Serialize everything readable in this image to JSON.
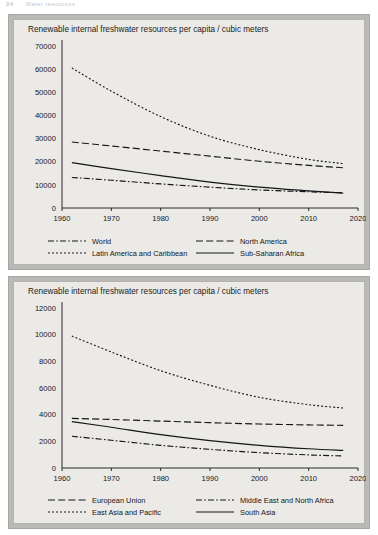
{
  "page_header": {
    "number": "24",
    "text": "Water resources"
  },
  "figures": [
    {
      "id": "figure-1",
      "title": "Renewable internal freshwater resources per capita / cubic meters",
      "chart_data": {
        "type": "line",
        "title": "Renewable internal freshwater resources per capita / cubic meters",
        "xlabel": "",
        "ylabel": "",
        "xlim": [
          1960,
          2020
        ],
        "ylim": [
          0,
          70000
        ],
        "xticks": [
          1960,
          1970,
          1980,
          1990,
          2000,
          2010,
          2020
        ],
        "yticks": [
          0,
          10000,
          20000,
          30000,
          40000,
          50000,
          60000,
          70000
        ],
        "grid": false,
        "legend_position": "below",
        "x": [
          1962,
          1970,
          1980,
          1990,
          2000,
          2010,
          2017
        ],
        "series": [
          {
            "name": "World",
            "dash": "dash-dot",
            "values": [
              13200,
              12000,
              10400,
              9000,
              7800,
              7000,
              6600
            ]
          },
          {
            "name": "North America",
            "dash": "dashed",
            "values": [
              28500,
              26800,
              24600,
              22400,
              20200,
              18400,
              17400
            ]
          },
          {
            "name": "Latin America and Caribbean",
            "dash": "dotted",
            "values": [
              60500,
              50500,
              39500,
              31000,
              25200,
              21000,
              19200
            ]
          },
          {
            "name": "Sub-Saharan Africa",
            "dash": "solid",
            "values": [
              19600,
              17000,
              14000,
              11200,
              9000,
              7400,
              6400
            ]
          }
        ]
      }
    },
    {
      "id": "figure-2",
      "title": "Renewable internal freshwater resources per capita / cubic meters",
      "chart_data": {
        "type": "line",
        "title": "Renewable internal freshwater resources per capita / cubic meters",
        "xlabel": "",
        "ylabel": "",
        "xlim": [
          1960,
          2020
        ],
        "ylim": [
          0,
          12000
        ],
        "xticks": [
          1960,
          1970,
          1980,
          1990,
          2000,
          2010,
          2020
        ],
        "yticks": [
          0,
          2000,
          4000,
          6000,
          8000,
          10000,
          12000
        ],
        "grid": false,
        "legend_position": "below",
        "x": [
          1962,
          1970,
          1980,
          1990,
          2000,
          2010,
          2017
        ],
        "series": [
          {
            "name": "European Union",
            "dash": "dashed",
            "values": [
              3720,
              3640,
              3520,
              3400,
              3300,
              3230,
              3200
            ]
          },
          {
            "name": "Middle East and North Africa",
            "dash": "dash-dot",
            "values": [
              2380,
              2080,
              1700,
              1400,
              1150,
              980,
              900
            ]
          },
          {
            "name": "East Asia and Pacific",
            "dash": "dotted",
            "values": [
              9900,
              8700,
              7300,
              6200,
              5300,
              4750,
              4500
            ]
          },
          {
            "name": "South Asia",
            "dash": "solid",
            "values": [
              3480,
              3060,
              2500,
              2050,
              1700,
              1440,
              1320
            ]
          }
        ]
      }
    }
  ]
}
